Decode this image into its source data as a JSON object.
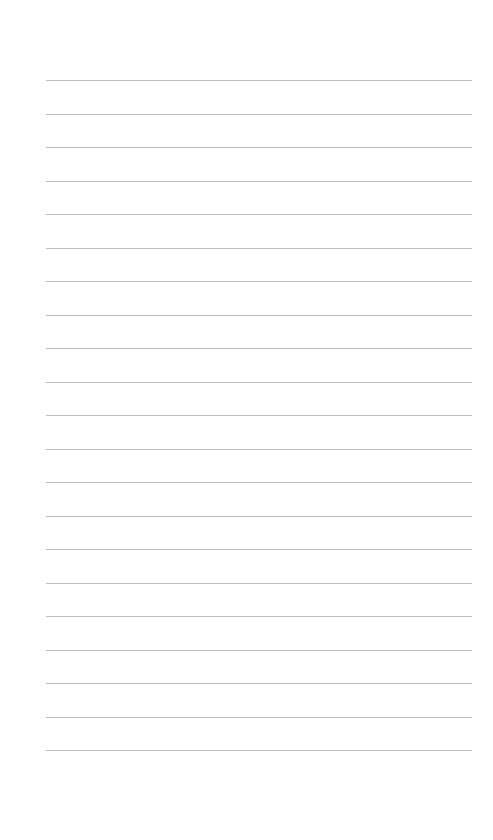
{
  "page": {
    "type": "lined-paper",
    "background_color": "#ffffff",
    "line_color": "#bdbdbd",
    "line_count": 21,
    "first_line_y": 80,
    "line_spacing": 33.5,
    "line_left": 46,
    "line_right": 472,
    "lines": [
      "",
      "",
      "",
      "",
      "",
      "",
      "",
      "",
      "",
      "",
      "",
      "",
      "",
      "",
      "",
      "",
      "",
      "",
      "",
      "",
      ""
    ]
  }
}
